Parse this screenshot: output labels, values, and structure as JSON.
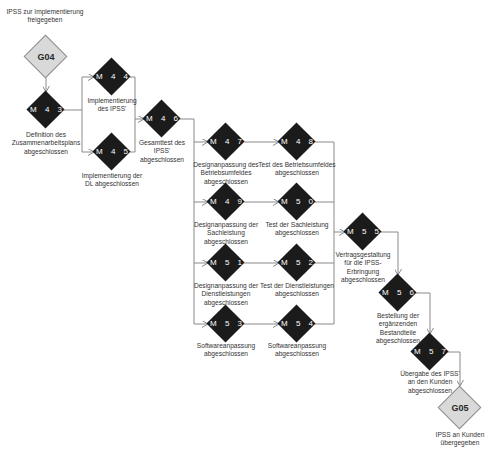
{
  "diagram": {
    "type": "milestone-flow",
    "colors": {
      "milestone_fill": "#1b1b1b",
      "gate_fill": "#d9d9d9",
      "gate_border": "#8f8f8f",
      "line": "#8a8a8a",
      "text": "#333333"
    },
    "gates": {
      "g04": {
        "code": "G04",
        "label": "IPSS zur Implementierung\nfreigegeben"
      },
      "g05": {
        "code": "G05",
        "label": "IPSS an Kunden\nübergegeben"
      }
    },
    "milestones": {
      "m43": {
        "code": "M 4 3",
        "label": "Definition des\nZusammenarbeitsplans\nabgeschlossen"
      },
      "m44": {
        "code": "M 4 4",
        "label": "Implementierung\ndes IPSS'"
      },
      "m45": {
        "code": "M 4 5",
        "label": "Implementierung der\nDL abgeschlossen"
      },
      "m46": {
        "code": "M 4 6",
        "label": "Gesamttest des\nIPSS'\nabgeschlossen"
      },
      "m47": {
        "code": "M 4 7",
        "label": "Designanpassung des\nBetriebsumfeldes\nabgeschlossen"
      },
      "m48": {
        "code": "M 4 8",
        "label": "Test des Betriebsumfeldes\nabgeschlossen"
      },
      "m49": {
        "code": "M 4 9",
        "label": "Designanpassung der\nSachleistung\nabgeschlossen"
      },
      "m50": {
        "code": "M 5 0",
        "label": "Test der Sachleistung\nabgeschlossen"
      },
      "m51": {
        "code": "M 5 1",
        "label": "Designanpassung der\nDienstleistungen\nabgeschlossen"
      },
      "m52": {
        "code": "M 5 2",
        "label": "Test der Dienstleistungen\nabgeschlossen"
      },
      "m53": {
        "code": "M 5 3",
        "label": "Softwareanpassung\nabgeschlossen"
      },
      "m54": {
        "code": "M 5 4",
        "label": "Softwareanpassung\nabgeschlossen"
      },
      "m55": {
        "code": "M 5 5",
        "label": "Vertragsgestaltung\nfür die IPSS-\nErbringung\nabgeschlossen"
      },
      "m56": {
        "code": "M 5 6",
        "label": "Bestellung der\nergänzenden\nBestandteile\nabgeschlossen"
      },
      "m57": {
        "code": "M 5 7",
        "label": "Übergabe des IPSS'\nan den Kunden\nabgeschlossen"
      }
    }
  }
}
